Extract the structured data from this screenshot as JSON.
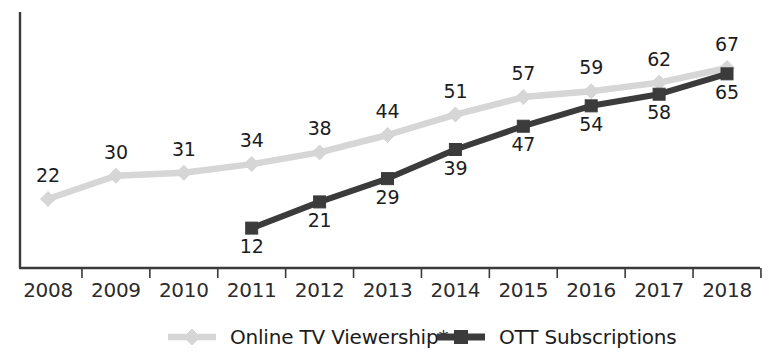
{
  "chart_data": {
    "type": "line",
    "title": "",
    "xlabel": "",
    "ylabel": "",
    "categories": [
      "2008",
      "2009",
      "2010",
      "2011",
      "2012",
      "2013",
      "2014",
      "2015",
      "2016",
      "2017",
      "2018"
    ],
    "series": [
      {
        "name": "Online TV Viewership*",
        "marker": "diamond",
        "color": "#d6d6d6",
        "label_color": "#1c1c1c",
        "values": [
          22,
          30,
          31,
          34,
          38,
          44,
          51,
          57,
          59,
          62,
          67
        ],
        "label_position": "above"
      },
      {
        "name": "OTT Subscriptions",
        "marker": "square",
        "color": "#3b3b3b",
        "label_color": "#1c1c1c",
        "values": [
          null,
          null,
          null,
          12,
          21,
          29,
          39,
          47,
          54,
          58,
          65
        ],
        "label_position": "below"
      }
    ],
    "ylim": [
      0,
      78
    ],
    "grid": false,
    "legend_position": "bottom",
    "axis_color": "#3a3a3a",
    "background": "#ffffff"
  },
  "legend": {
    "items": [
      {
        "label": "Online TV Viewership*",
        "color": "#d6d6d6",
        "marker": "diamond"
      },
      {
        "label": "OTT Subscriptions",
        "color": "#3b3b3b",
        "marker": "square"
      }
    ]
  },
  "axes": {
    "x_tick_labels": [
      "2008",
      "2009",
      "2010",
      "2011",
      "2012",
      "2013",
      "2014",
      "2015",
      "2016",
      "2017",
      "2018"
    ]
  },
  "title_fragment": ""
}
